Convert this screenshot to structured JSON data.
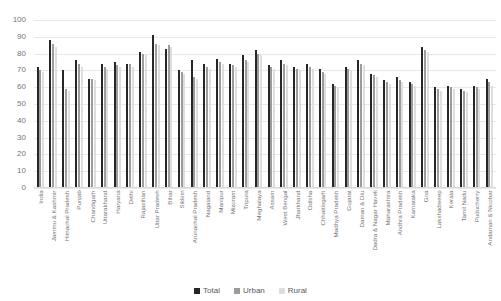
{
  "chart_data": {
    "type": "bar",
    "title": "",
    "subtitle": "",
    "xlabel": "",
    "ylabel": "",
    "ylim": [
      0,
      100
    ],
    "yticks": [
      0,
      10,
      20,
      30,
      40,
      50,
      60,
      70,
      80,
      90,
      100
    ],
    "grid": true,
    "legend_position": "bottom",
    "categories": [
      "India",
      "Jammu & Kashmir",
      "Himachal Pradesh",
      "Punjab",
      "Chandigarh",
      "Uttarakhand",
      "Haryana",
      "Delhi",
      "Rajasthan",
      "Uttar Pradesh",
      "Bihar",
      "Sikkim",
      "Arunachal Pradesh",
      "Nagaland",
      "Manipur",
      "Mizoram",
      "Tripura",
      "Meghalaya",
      "Assam",
      "West Bengal",
      "Jharkhand",
      "Odisha",
      "Chhattisgarh",
      "Madhya Pradesh",
      "Gujarat",
      "Daman & Diu",
      "Dadra & Nagar Haveli",
      "Maharashtra",
      "Andhra Pradesh",
      "Karnataka",
      "Goa",
      "Lakshadweep",
      "Kerala",
      "Tamil Nadu",
      "Puducherry",
      "Andaman & Nicobar"
    ],
    "series": [
      {
        "name": "Total",
        "color": "#262626",
        "values": [
          72,
          88,
          70,
          76,
          65,
          74,
          75,
          74,
          81,
          91,
          83,
          70,
          76,
          74,
          77,
          74,
          79,
          82,
          73,
          76,
          72,
          74,
          71,
          62,
          72,
          76,
          68,
          64,
          66,
          63,
          84,
          60,
          61,
          59,
          61,
          65
        ]
      },
      {
        "name": "Urban",
        "color": "#9c9c9c",
        "values": [
          70,
          86,
          59,
          74,
          65,
          72,
          73,
          74,
          80,
          86,
          85,
          69,
          66,
          72,
          75,
          73,
          76,
          80,
          72,
          74,
          71,
          72,
          69,
          61,
          71,
          74,
          67,
          63,
          64,
          62,
          82,
          59,
          60,
          58,
          60,
          63
        ]
      },
      {
        "name": "Rural",
        "color": "#dedede",
        "values": [
          69,
          84,
          58,
          72,
          64,
          71,
          72,
          72,
          79,
          85,
          84,
          68,
          65,
          71,
          74,
          72,
          75,
          79,
          71,
          73,
          70,
          71,
          68,
          60,
          70,
          73,
          66,
          62,
          63,
          61,
          81,
          58,
          59,
          57,
          59,
          61
        ]
      }
    ]
  },
  "legend": {
    "items": [
      {
        "label": "Total",
        "key": "total"
      },
      {
        "label": "Urban",
        "key": "urban"
      },
      {
        "label": "Rural",
        "key": "rural"
      }
    ]
  }
}
